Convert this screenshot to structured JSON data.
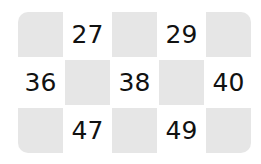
{
  "grid": {
    "rows": 3,
    "cols": 5,
    "shaded_color": "#e6e6e6",
    "cells": [
      [
        "",
        "27",
        "",
        "29",
        ""
      ],
      [
        "36",
        "",
        "38",
        "",
        "40"
      ],
      [
        "",
        "47",
        "",
        "49",
        ""
      ]
    ]
  }
}
